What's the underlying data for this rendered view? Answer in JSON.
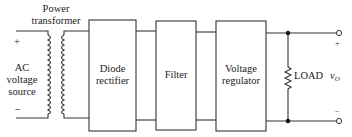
{
  "diagram": {
    "source": {
      "label_lines": [
        "AC",
        "voltage",
        "source"
      ],
      "plus": "+",
      "minus": "−"
    },
    "transformer": {
      "label_lines": [
        "Power",
        "transformer"
      ]
    },
    "blocks": [
      {
        "id": "rectifier",
        "lines": [
          "Diode",
          "rectifier"
        ]
      },
      {
        "id": "filter",
        "lines": [
          "Filter"
        ]
      },
      {
        "id": "regulator",
        "lines": [
          "Voltage",
          "regulator"
        ]
      }
    ],
    "load": {
      "label": "LOAD"
    },
    "output": {
      "symbol": "v",
      "subscript": "O",
      "plus": "+",
      "minus": "−"
    },
    "colors": {
      "line": "#333333",
      "background": "#ffffff"
    }
  }
}
